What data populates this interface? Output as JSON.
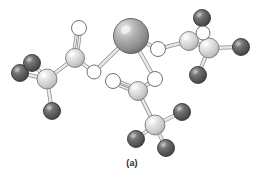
{
  "figure": {
    "caption": "(a)",
    "background_color": "#ffffff",
    "title": ""
  },
  "palette": {
    "metal_sphere": "#9a9a9a",
    "metal_highlight": "#e2e2e2",
    "metal_edge": "#4a4a4a",
    "carbon_sphere": "#d6d6d6",
    "carbon_highlight": "#f5f5f5",
    "carbon_edge": "#6e6e6e",
    "hydrogen_sphere": "#5a5a5a",
    "hydrogen_highlight": "#9c9c9c",
    "hydrogen_edge": "#262626",
    "oxygen_fill": "#ffffff",
    "oxygen_edge": "#707070",
    "bond_fill": "#e8e8e8",
    "bond_edge": "#8a8a8a"
  },
  "legend": {
    "metal_label": "metal ion",
    "carbon_label": "carbon",
    "hydrogen_label": "hydrogen",
    "oxygen_label": "oxygen"
  },
  "chart_data": {
    "type": "scatter",
    "title": "(a)",
    "xlabel": "",
    "ylabel": "",
    "xlim": [
      0,
      264
    ],
    "ylim": [
      0,
      189
    ],
    "grid": false,
    "legend_position": "none",
    "atoms": [
      {
        "id": "M1",
        "element": "metal",
        "x": 131,
        "y": 36,
        "r": 17.5
      },
      {
        "id": "C1",
        "element": "carbon",
        "x": 75,
        "y": 58,
        "r": 9.5
      },
      {
        "id": "O1",
        "element": "oxygen",
        "x": 79,
        "y": 28,
        "r": 7.5
      },
      {
        "id": "O2",
        "element": "oxygen",
        "x": 94,
        "y": 72,
        "r": 7.0
      },
      {
        "id": "C2",
        "element": "carbon",
        "x": 47,
        "y": 79,
        "r": 10.0
      },
      {
        "id": "H1",
        "element": "hydrogen",
        "x": 20,
        "y": 73,
        "r": 8.5
      },
      {
        "id": "H2",
        "element": "hydrogen",
        "x": 32,
        "y": 63,
        "r": 8.5
      },
      {
        "id": "H3",
        "element": "hydrogen",
        "x": 52,
        "y": 111,
        "r": 8.5
      },
      {
        "id": "O3",
        "element": "oxygen",
        "x": 158,
        "y": 49,
        "r": 7.5
      },
      {
        "id": "C3",
        "element": "carbon",
        "x": 189,
        "y": 41,
        "r": 9.5
      },
      {
        "id": "O4",
        "element": "oxygen",
        "x": 203,
        "y": 33,
        "r": 7.0
      },
      {
        "id": "C4",
        "element": "carbon",
        "x": 209,
        "y": 48,
        "r": 10.0
      },
      {
        "id": "H4",
        "element": "hydrogen",
        "x": 202,
        "y": 18,
        "r": 8.5
      },
      {
        "id": "H5",
        "element": "hydrogen",
        "x": 241,
        "y": 47,
        "r": 8.5
      },
      {
        "id": "H6",
        "element": "hydrogen",
        "x": 198,
        "y": 75,
        "r": 8.5
      },
      {
        "id": "O5",
        "element": "oxygen",
        "x": 155,
        "y": 79,
        "r": 7.5
      },
      {
        "id": "C5",
        "element": "carbon",
        "x": 138,
        "y": 91,
        "r": 9.5
      },
      {
        "id": "O6",
        "element": "oxygen",
        "x": 113,
        "y": 81,
        "r": 7.5
      },
      {
        "id": "C6",
        "element": "carbon",
        "x": 155,
        "y": 125,
        "r": 10.0
      },
      {
        "id": "H7",
        "element": "hydrogen",
        "x": 182,
        "y": 112,
        "r": 8.5
      },
      {
        "id": "H8",
        "element": "hydrogen",
        "x": 136,
        "y": 139,
        "r": 8.5
      },
      {
        "id": "H9",
        "element": "hydrogen",
        "x": 166,
        "y": 148,
        "r": 8.5
      }
    ],
    "bonds": [
      {
        "from": "C1",
        "to": "O1",
        "order": 2
      },
      {
        "from": "C1",
        "to": "O2",
        "order": 1
      },
      {
        "from": "C1",
        "to": "C2",
        "order": 1
      },
      {
        "from": "C2",
        "to": "H1",
        "order": 1
      },
      {
        "from": "C2",
        "to": "H2",
        "order": 1
      },
      {
        "from": "C2",
        "to": "H3",
        "order": 1
      },
      {
        "from": "O2",
        "to": "M1",
        "order": 1
      },
      {
        "from": "M1",
        "to": "O3",
        "order": 1
      },
      {
        "from": "O3",
        "to": "C3",
        "order": 1
      },
      {
        "from": "C3",
        "to": "C4",
        "order": 1
      },
      {
        "from": "C4",
        "to": "O4",
        "order": 2
      },
      {
        "from": "O4",
        "to": "C3",
        "order": 1
      },
      {
        "from": "C4",
        "to": "H4",
        "order": 1
      },
      {
        "from": "C4",
        "to": "H5",
        "order": 1
      },
      {
        "from": "C4",
        "to": "H6",
        "order": 1
      },
      {
        "from": "M1",
        "to": "O5",
        "order": 1
      },
      {
        "from": "O5",
        "to": "C5",
        "order": 1
      },
      {
        "from": "C5",
        "to": "O6",
        "order": 2
      },
      {
        "from": "C5",
        "to": "C6",
        "order": 1
      },
      {
        "from": "C6",
        "to": "H7",
        "order": 1
      },
      {
        "from": "C6",
        "to": "H8",
        "order": 1
      },
      {
        "from": "C6",
        "to": "H9",
        "order": 1
      }
    ]
  }
}
